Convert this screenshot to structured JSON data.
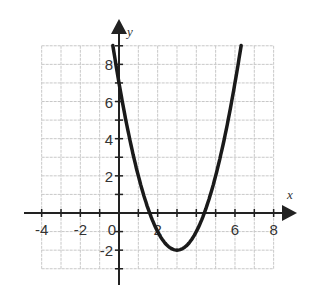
{
  "chart_data": {
    "type": "line",
    "title": "",
    "xlabel": "x",
    "ylabel": "y",
    "equation": "y = (x - 3)^2 - 2",
    "xlim": [
      -4,
      8
    ],
    "ylim": [
      -3,
      9
    ],
    "grid": true,
    "grid_step": 1,
    "x_ticks": [
      -4,
      -2,
      0,
      2,
      6,
      8
    ],
    "x_tick_labels": [
      "-4",
      "-2",
      "0",
      "2",
      "6",
      "8"
    ],
    "y_ticks": [
      8,
      6,
      4,
      2,
      -2
    ],
    "y_tick_labels": [
      "8",
      "6",
      "4",
      "2",
      "-2"
    ],
    "series": [
      {
        "name": "parabola",
        "x": [
          -0.32,
          0,
          0.5,
          1,
          1.59,
          2,
          2.5,
          3,
          3.5,
          4,
          4.41,
          5,
          5.5,
          6,
          6.32
        ],
        "y": [
          9,
          7,
          4.25,
          2,
          0,
          -1,
          -1.75,
          -2,
          -1.75,
          -1,
          0,
          2,
          4.25,
          7,
          9
        ]
      }
    ],
    "vertex": [
      3,
      -2
    ],
    "x_intercepts": [
      1.59,
      4.41
    ],
    "y_intercept": 7
  },
  "colors": {
    "curve": "#1a1a1a",
    "axis": "#222222",
    "grid": "#c8c8c8"
  }
}
